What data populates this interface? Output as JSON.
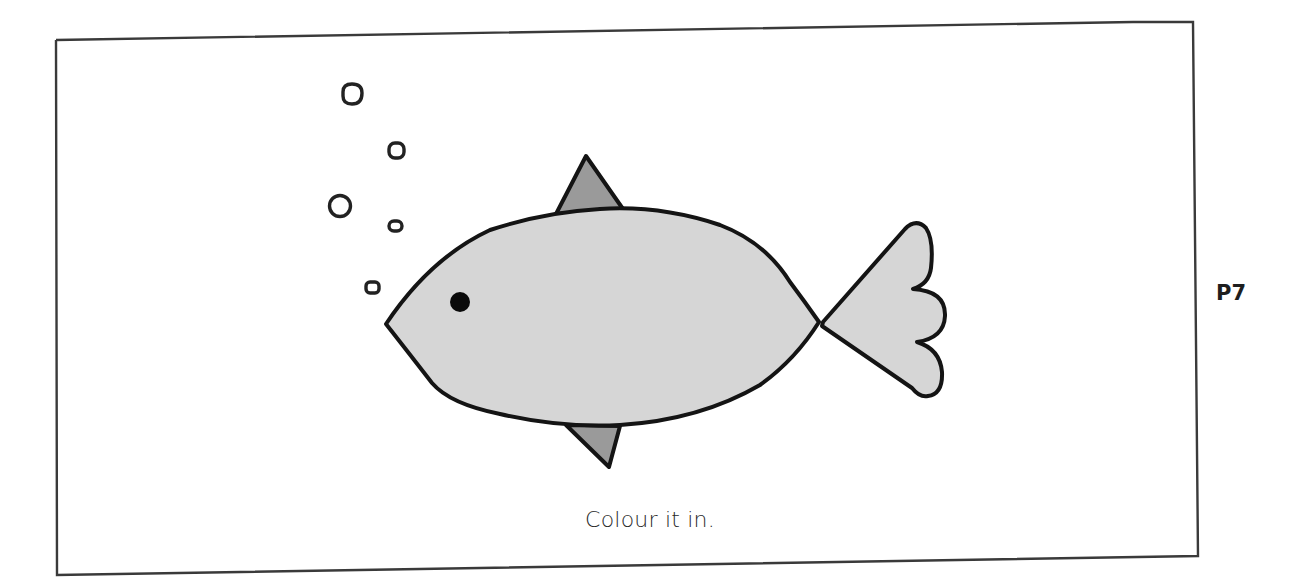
{
  "worksheet": {
    "instruction": "Colour it in.",
    "page_label": "P7"
  },
  "illustration": {
    "subject": "fish",
    "bubble_count": 6,
    "colors": {
      "body_fill": "#d6d6d6",
      "fin_fill": "#9a9a9a",
      "outline": "#141414",
      "eye": "#0a0a0a",
      "frame": "#3a3a3a"
    }
  }
}
